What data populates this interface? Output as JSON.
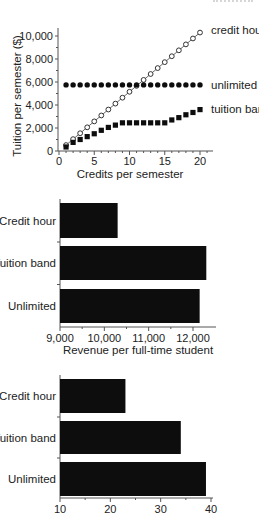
{
  "chart_data": [
    {
      "type": "scatter",
      "title": "",
      "xlabel": "Credits per semester",
      "ylabel": "Tuition per semester ($)",
      "xlim": [
        0,
        21
      ],
      "ylim": [
        0,
        11000
      ],
      "x_ticks": [
        0,
        5,
        10,
        15,
        20
      ],
      "x_tick_labels": [
        "0",
        "5",
        "10",
        "15",
        "20"
      ],
      "y_ticks": [
        0,
        2000,
        4000,
        6000,
        8000,
        10000
      ],
      "y_tick_labels": [
        "0",
        "2,000",
        "4,000",
        "6,000",
        "8,000",
        "10,000"
      ],
      "grid": false,
      "legend_position": "right (direct labels)",
      "x": [
        1,
        2,
        3,
        4,
        5,
        6,
        7,
        8,
        9,
        10,
        11,
        12,
        13,
        14,
        15,
        16,
        17,
        18,
        19,
        20
      ],
      "series": [
        {
          "name": "credit hour",
          "marker": "open-circle",
          "connected": true,
          "values": [
            515,
            1030,
            1545,
            2060,
            2575,
            3090,
            3605,
            4120,
            4635,
            5150,
            5665,
            6180,
            6695,
            7210,
            7725,
            8240,
            8755,
            9270,
            9785,
            10300
          ]
        },
        {
          "name": "unlimited",
          "marker": "filled-circle",
          "connected": false,
          "values": [
            5750,
            5750,
            5750,
            5750,
            5750,
            5750,
            5750,
            5750,
            5750,
            5750,
            5750,
            5750,
            5750,
            5750,
            5750,
            5750,
            5750,
            5750,
            5750,
            5750
          ]
        },
        {
          "name": "tuition band",
          "marker": "filled-square",
          "connected": false,
          "values": [
            350,
            750,
            1000,
            1250,
            1500,
            1800,
            2050,
            2250,
            2450,
            2450,
            2450,
            2450,
            2450,
            2450,
            2450,
            2700,
            2900,
            3150,
            3350,
            3600
          ]
        }
      ]
    },
    {
      "type": "bar",
      "orientation": "horizontal",
      "title": "",
      "xlabel": "Revenue per full-time student",
      "ylabel": "",
      "categories": [
        "Credit hour",
        "Tuition band",
        "Unlimited"
      ],
      "values": [
        10300,
        12300,
        12150
      ],
      "xlim": [
        9000,
        12500
      ],
      "x_ticks": [
        9000,
        10000,
        11000,
        12000
      ],
      "x_tick_labels": [
        "9,000",
        "10,000",
        "11,000",
        "12,000"
      ],
      "grid": false,
      "bar_color": "#0d0d0d"
    },
    {
      "type": "bar",
      "orientation": "horizontal",
      "title": "",
      "xlabel": "",
      "ylabel": "",
      "categories": [
        "Credit hour",
        "Tuition band",
        "Unlimited"
      ],
      "values": [
        23,
        34,
        39
      ],
      "xlim": [
        10,
        40
      ],
      "x_ticks": [
        10,
        20,
        30,
        40
      ],
      "x_tick_labels": [
        "10",
        "20",
        "30",
        "40"
      ],
      "grid": false,
      "bar_color": "#0d0d0d"
    }
  ],
  "colors": {
    "ink": "#0d0d0d",
    "axis": "#555555",
    "background": "#ffffff"
  }
}
